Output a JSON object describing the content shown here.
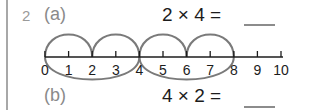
{
  "question": {
    "number": "2",
    "parts": [
      {
        "label": "(a)",
        "equation": "2 × 4 =",
        "answer_blank": "___"
      },
      {
        "label": "(b)",
        "equation": "4 × 2 =",
        "answer_blank": "___"
      }
    ]
  },
  "number_line": {
    "start": 0,
    "end": 10,
    "tick_labels": [
      "0",
      "1",
      "2",
      "3",
      "4",
      "5",
      "6",
      "7",
      "8",
      "9",
      "10"
    ],
    "upper_jumps": [
      [
        0,
        2
      ],
      [
        2,
        4
      ],
      [
        4,
        6
      ],
      [
        6,
        8
      ]
    ],
    "lower_jumps": [
      [
        0,
        4
      ],
      [
        4,
        8
      ]
    ]
  },
  "colors": {
    "arc": "#7a7a7a",
    "line": "#1c1c1c",
    "label": "#8a8a8a"
  }
}
